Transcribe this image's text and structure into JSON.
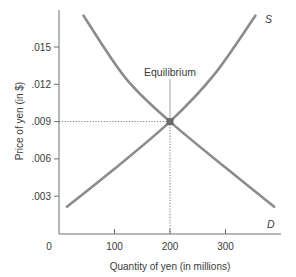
{
  "chart_data": {
    "type": "line",
    "title": "",
    "xlabel": "Quantity of yen (in millions)",
    "ylabel": "Price of yen (in $)",
    "xlim": [
      0,
      400
    ],
    "ylim": [
      0,
      0.018
    ],
    "x_ticks": [
      {
        "value": 0,
        "label": "0"
      },
      {
        "value": 100,
        "label": "100"
      },
      {
        "value": 200,
        "label": "200"
      },
      {
        "value": 300,
        "label": "300"
      }
    ],
    "y_ticks": [
      {
        "value": 0.003,
        "label": ".003"
      },
      {
        "value": 0.006,
        "label": ".006"
      },
      {
        "value": 0.009,
        "label": ".009"
      },
      {
        "value": 0.012,
        "label": ".012"
      },
      {
        "value": 0.015,
        "label": ".015"
      }
    ],
    "grid": false,
    "series": [
      {
        "name": "D",
        "label": "D",
        "description": "Demand",
        "color": "#8c8c8c",
        "points": [
          [
            43,
            0.0176
          ],
          [
            120,
            0.0125
          ],
          [
            200,
            0.009
          ],
          [
            300,
            0.0053
          ],
          [
            389,
            0.0021
          ]
        ]
      },
      {
        "name": "S",
        "label": "S",
        "description": "Supply",
        "color": "#8c8c8c",
        "points": [
          [
            13,
            0.0021
          ],
          [
            100,
            0.0052
          ],
          [
            200,
            0.009
          ],
          [
            280,
            0.0128
          ],
          [
            355,
            0.0176
          ]
        ]
      }
    ],
    "annotations": [
      {
        "text": "Equilibrium",
        "x": 200,
        "y": 0.009,
        "marker": "square",
        "guides": "dotted"
      }
    ]
  }
}
